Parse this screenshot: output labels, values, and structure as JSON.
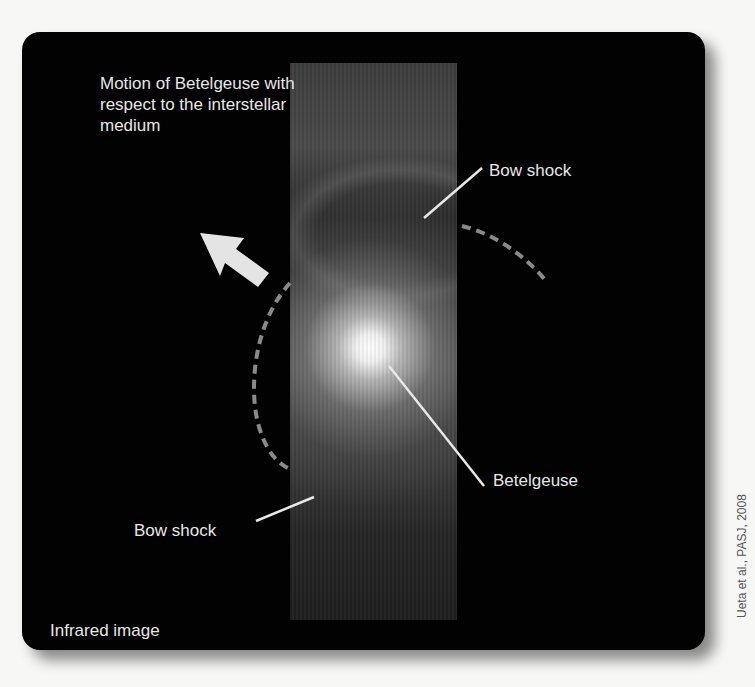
{
  "figure": {
    "panel_background": "#020202",
    "annotation_color": "#e6e6e6",
    "dash_color": "#8a8a8a",
    "labels": {
      "motion": "Motion of Betelgeuse with respect to the interstellar medium",
      "bow_shock_top": "Bow shock",
      "bow_shock_bottom": "Bow shock",
      "star": "Betelgeuse",
      "image_type": "Infrared image"
    },
    "credit": "Ueta et al., PASJ, 2008",
    "icons": {
      "motion_arrow": "arrow-up-left-icon"
    }
  }
}
